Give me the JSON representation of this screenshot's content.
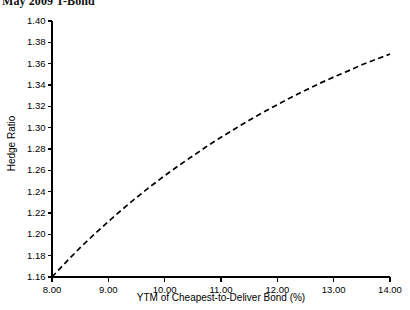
{
  "chart_data": {
    "type": "line",
    "title": "May 2009 T-Bond",
    "xlabel": "YTM of Cheapest-to-Deliver Bond (%)",
    "ylabel": "Hedge Ratio",
    "xlim": [
      8.0,
      14.0
    ],
    "ylim": [
      1.16,
      1.4
    ],
    "grid": false,
    "legend": false,
    "line_style": "dashed",
    "line_color": "#000000",
    "x_ticks": [
      "8.00",
      "9.00",
      "10.00",
      "11.00",
      "12.00",
      "13.00",
      "14.00"
    ],
    "y_ticks": [
      "1.40",
      "1.38",
      "1.36",
      "1.34",
      "1.32",
      "1.30",
      "1.28",
      "1.26",
      "1.24",
      "1.22",
      "1.20",
      "1.18",
      "1.16"
    ],
    "series": [
      {
        "name": "Hedge Ratio",
        "x": [
          8.0,
          8.25,
          8.5,
          8.75,
          9.0,
          9.25,
          9.5,
          9.75,
          10.0,
          10.25,
          10.5,
          10.75,
          11.0,
          11.25,
          11.5,
          11.75,
          12.0,
          12.25,
          12.5,
          12.75,
          13.0,
          13.25,
          13.5,
          13.75,
          14.0
        ],
        "values": [
          1.16,
          1.174,
          1.1875,
          1.2,
          1.212,
          1.2235,
          1.2345,
          1.245,
          1.255,
          1.2645,
          1.2735,
          1.2825,
          1.291,
          1.299,
          1.307,
          1.3145,
          1.3215,
          1.3285,
          1.335,
          1.3415,
          1.3475,
          1.353,
          1.359,
          1.364,
          1.369
        ]
      }
    ]
  },
  "axes": {
    "x_tick_labels": [
      "8.00",
      "9.00",
      "10.00",
      "11.00",
      "12.00",
      "13.00",
      "14.00"
    ],
    "y_tick_labels": [
      "1.40",
      "1.38",
      "1.36",
      "1.34",
      "1.32",
      "1.30",
      "1.28",
      "1.26",
      "1.24",
      "1.22",
      "1.20",
      "1.18",
      "1.16"
    ]
  }
}
